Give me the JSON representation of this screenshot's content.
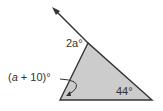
{
  "figure": {
    "type": "triangle with exterior angle",
    "fill_color": "#cccccc",
    "stroke_color": "#333333",
    "labels": {
      "top_angle": {
        "var": "2a",
        "suffix": "°"
      },
      "exterior_angle": {
        "open": "(",
        "var": "a",
        "rest": " + 10)",
        "suffix": "°"
      },
      "bottom_right_angle": "44°"
    }
  }
}
